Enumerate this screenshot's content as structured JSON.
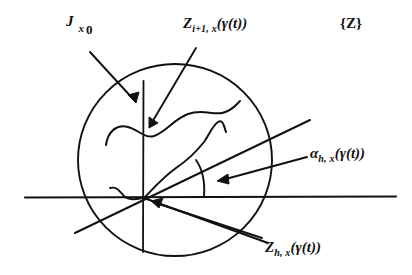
{
  "figure": {
    "background_color": "#ffffff",
    "ink_color": "#111111",
    "width": 412,
    "height": 275
  },
  "labels": {
    "jacobi": {
      "symbol": "J",
      "subscript_x": "x",
      "subscript_zero": "0",
      "full_text": "J x0"
    },
    "z_iplus1": {
      "symbol": "Z",
      "subscript": "i+1, x",
      "argument": "(γ(t))",
      "full_text": "Zi+1, x(γ(t))"
    },
    "bracket_z": {
      "full_text": "{Z}"
    },
    "alpha_h": {
      "symbol": "α",
      "subscript": "h, x",
      "argument": "(γ(t))",
      "full_text": "αh, x(γ(t))"
    },
    "z_h": {
      "symbol": "Z",
      "subscript": "h, x",
      "argument": "(γ(t))",
      "full_text": "Zh, x(γ(t))"
    }
  },
  "geometry": {
    "circle": {
      "center_x": 175,
      "center_y": 160,
      "radius_x": 97,
      "radius_y": 97
    },
    "horizontal_line": {
      "x1": 25,
      "y1": 197,
      "x2": 396,
      "y2": 197
    },
    "vertical_line": {
      "x1": 143,
      "y1": 81,
      "x2": 143,
      "y2": 252
    },
    "center_point": {
      "x": 144,
      "y": 198
    },
    "diagonal_up_right": {
      "x1": 75,
      "y1": 233,
      "x2": 310,
      "y2": 120
    },
    "diagonal_down_right": {
      "x1": 144,
      "y1": 198,
      "x2": 268,
      "y2": 243
    },
    "angle_arc_label": "angle between horizontal axis and diagonal"
  }
}
